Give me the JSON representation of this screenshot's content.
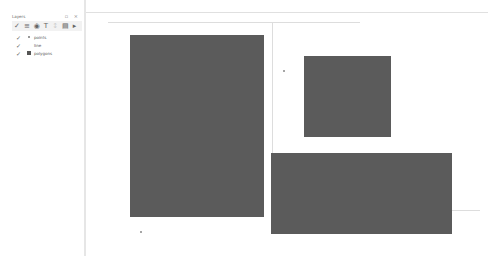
{
  "layers_panel": {
    "title": "Layers",
    "controls": "▫ ×",
    "toolbar": [
      {
        "icon": "open-layer-styling-icon",
        "glyph": "✓"
      },
      {
        "icon": "add-group-icon",
        "glyph": "≡"
      },
      {
        "icon": "visibility-icon",
        "glyph": "◉"
      },
      {
        "icon": "filter-icon",
        "glyph": "T"
      },
      {
        "icon": "expand-icon",
        "glyph": "↕",
        "dim": true
      },
      {
        "icon": "collapse-icon",
        "glyph": "▤"
      },
      {
        "icon": "remove-layer-icon",
        "glyph": "▸"
      }
    ],
    "layers": [
      {
        "name": "points",
        "checked": true,
        "symbol": "point"
      },
      {
        "name": "line",
        "checked": true,
        "symbol": "line"
      },
      {
        "name": "polygons",
        "checked": true,
        "symbol": "polygon"
      }
    ]
  },
  "map_canvas": {
    "polygon_color": "#5b5b5b",
    "line_color": "#dddddd",
    "background": "#ffffff"
  }
}
